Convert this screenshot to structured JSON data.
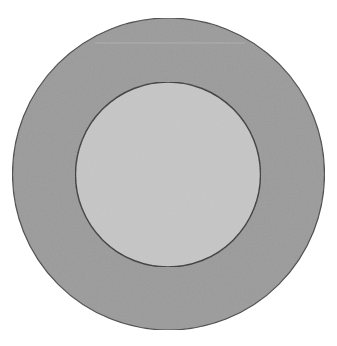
{
  "diagram": {
    "type": "concentric-circles",
    "outer_circle": {
      "cx": 168.5,
      "cy": 174,
      "r": 156,
      "fill": "#9b9b9b",
      "stroke": "#4a4a4a"
    },
    "inner_circle": {
      "cx": 168,
      "cy": 174.5,
      "r": 92.5,
      "fill": "#c6c6c6",
      "stroke": "#3a3a3a"
    },
    "artifact_line": {
      "y": 43,
      "x1": 95,
      "x2": 245,
      "color": "#b4b4b4"
    }
  }
}
